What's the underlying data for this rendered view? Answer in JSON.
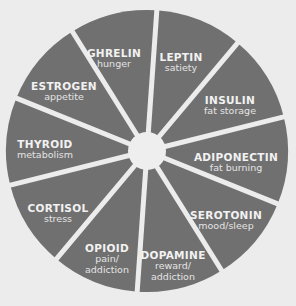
{
  "diagram": {
    "type": "wheel",
    "colors": {
      "segment_fill": "#707070",
      "separator": "#ececec",
      "hub": "#eeeeee",
      "text": "#f2f2f2"
    },
    "center_label": "",
    "segments": [
      {
        "name": "GHRELIN",
        "description": "hunger"
      },
      {
        "name": "LEPTIN",
        "description": "satiety"
      },
      {
        "name": "INSULIN",
        "description": "fat storage"
      },
      {
        "name": "ADIPONECTIN",
        "description": "fat burning"
      },
      {
        "name": "SEROTONIN",
        "description": "mood/sleep"
      },
      {
        "name": "DOPAMINE",
        "description": "reward/ addiction"
      },
      {
        "name": "OPIOID",
        "description": "pain/ addiction"
      },
      {
        "name": "CORTISOL",
        "description": "stress"
      },
      {
        "name": "THYROID",
        "description": "metabolism"
      },
      {
        "name": "ESTROGEN",
        "description": "appetite"
      }
    ]
  }
}
